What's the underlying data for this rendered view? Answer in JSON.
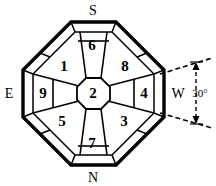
{
  "figure": {
    "shape": "octagon",
    "stroke_color": "#000000",
    "fill_color": "#ffffff",
    "zones": [
      {
        "id": "1",
        "label": "1",
        "cx": 64,
        "cy": 66
      },
      {
        "id": "2",
        "label": "2",
        "cx": 93,
        "cy": 93
      },
      {
        "id": "3",
        "label": "3",
        "cx": 124,
        "cy": 121
      },
      {
        "id": "4",
        "label": "4",
        "cx": 144,
        "cy": 93
      },
      {
        "id": "5",
        "label": "5",
        "cx": 62,
        "cy": 121
      },
      {
        "id": "6",
        "label": "6",
        "cx": 92,
        "cy": 45
      },
      {
        "id": "7",
        "label": "7",
        "cx": 92,
        "cy": 143
      },
      {
        "id": "8",
        "label": "8",
        "cx": 125,
        "cy": 66
      },
      {
        "id": "9",
        "label": "9",
        "cx": 43,
        "cy": 93
      }
    ],
    "compass": [
      {
        "id": "south",
        "label": "S",
        "x": 93,
        "y": 9
      },
      {
        "id": "north",
        "label": "N",
        "x": 93,
        "y": 177
      },
      {
        "id": "east",
        "label": "E",
        "x": 9,
        "y": 93
      },
      {
        "id": "west",
        "label": "W",
        "x": 178,
        "y": 93
      }
    ],
    "annotation": {
      "id": "angle-30",
      "label": "30°",
      "x": 199,
      "y": 93,
      "style": "dashed-leader-lines-with-dimension-arrows"
    }
  }
}
